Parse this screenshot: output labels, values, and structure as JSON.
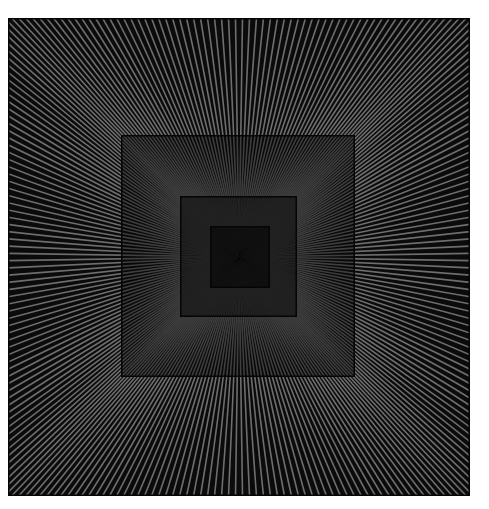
{
  "artwork": {
    "title": "Concentric squares with radiating lines",
    "canvas": {
      "width": 489,
      "height": 509,
      "background": "#ffffff"
    },
    "frame": {
      "x": 8,
      "y": 18,
      "width": 462,
      "height": 478,
      "fill": "#0b0b0b"
    },
    "center": {
      "x": 239,
      "y": 257
    },
    "rays": {
      "count_per_side": 66
    },
    "squares": [
      {
        "name": "outer",
        "x": 8,
        "y": 18,
        "width": 462,
        "height": 478,
        "line_color": "#6e6e6e",
        "bg": "#0b0b0b"
      },
      {
        "name": "middle",
        "x": 121,
        "y": 135,
        "width": 234,
        "height": 242,
        "line_color": "#3e3e3e",
        "bg": "#080808"
      },
      {
        "name": "inner",
        "x": 180,
        "y": 196,
        "width": 117,
        "height": 121,
        "line_color": "#222222",
        "bg": "#060606"
      },
      {
        "name": "core",
        "x": 210,
        "y": 226,
        "width": 60,
        "height": 62,
        "line_color": "#111111",
        "bg": "#040404"
      }
    ]
  }
}
